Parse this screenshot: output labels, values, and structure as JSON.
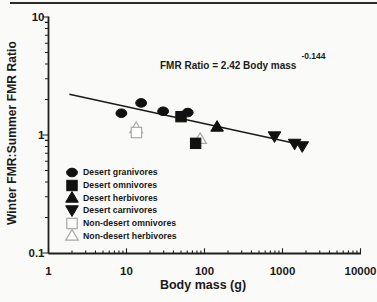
{
  "page": {
    "background": "#fafaf8",
    "divider_color": "#2b2b2b"
  },
  "chart_data": {
    "type": "scatter",
    "xlabel": "Body mass (g)",
    "ylabel": "Winter FMR:Summer FMR Ratio",
    "x_scale": "log",
    "y_scale": "log",
    "xlim": [
      1,
      10000
    ],
    "ylim": [
      0.1,
      10
    ],
    "x_ticks": [
      1,
      10,
      100,
      1000,
      10000
    ],
    "x_tick_labels": [
      "1",
      "10",
      "100",
      "1000",
      "10000"
    ],
    "y_ticks": [
      0.1,
      1,
      10
    ],
    "y_tick_labels": [
      "0.1",
      "1",
      "10"
    ],
    "grid": false,
    "legend_position": "lower-left-inside",
    "equation": {
      "text": "FMR Ratio = 2.42 Body mass",
      "exponent": "-0.144"
    },
    "regression_line": {
      "coefficient": 2.42,
      "exponent": -0.144,
      "x_start": 1.85,
      "x_end": 2000
    },
    "series": [
      {
        "name": "Desert granivores",
        "symbol": "ellipse",
        "style": "filled",
        "points": [
          [
            8.6,
            1.53
          ],
          [
            15.4,
            1.87
          ],
          [
            29.5,
            1.59
          ],
          [
            61,
            1.55
          ]
        ]
      },
      {
        "name": "Desert omnivores",
        "symbol": "square",
        "style": "filled",
        "points": [
          [
            50,
            1.43
          ],
          [
            77,
            0.85
          ]
        ]
      },
      {
        "name": "Desert herbivores",
        "symbol": "triangle-up",
        "style": "filled",
        "points": [
          [
            145,
            1.18
          ]
        ]
      },
      {
        "name": "Desert carnivores",
        "symbol": "triangle-down",
        "style": "filled",
        "points": [
          [
            790,
            0.97
          ],
          [
            1430,
            0.84
          ],
          [
            1790,
            0.8
          ]
        ]
      },
      {
        "name": "Non-desert omnivores",
        "symbol": "square",
        "style": "open",
        "points": [
          [
            13.4,
            1.05
          ]
        ]
      },
      {
        "name": "Non-desert herbivores",
        "symbol": "triangle-up",
        "style": "open",
        "points": [
          [
            13.3,
            1.15
          ],
          [
            88,
            0.93
          ]
        ]
      }
    ],
    "colors": {
      "filled": "#111111",
      "open_stroke": "#a9a9a9",
      "axis": "#1f1f1f",
      "text": "#1a1a1a"
    }
  }
}
